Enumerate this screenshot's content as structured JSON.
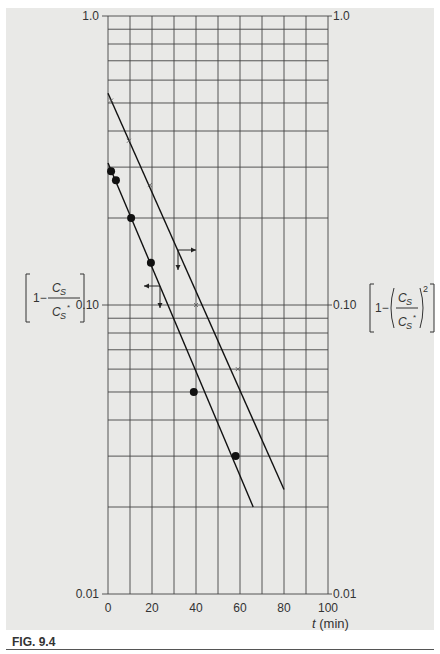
{
  "figure": {
    "caption": "FIG. 9.4",
    "x_axis_title": "t (min)",
    "left_axis_title": "[1 − C_S / C_S*]",
    "right_axis_title": "[1 − (C_S / C_S*)²]",
    "left_ticks": [
      "1.0",
      "0.10",
      "0.01"
    ],
    "right_ticks": [
      "1.0",
      "0.10",
      "0.01"
    ],
    "x_ticks": [
      "0",
      "20",
      "40",
      "60",
      "80",
      "100"
    ],
    "colors": {
      "background": "#e9e9e7",
      "grid": "#444444",
      "ink": "#111111"
    }
  },
  "chart_data": {
    "type": "scatter",
    "title": "",
    "xlabel": "t (min)",
    "ylabel_left": "1 − C_S/C_S*",
    "ylabel_right": "1 − (C_S/C_S*)²",
    "xlim": [
      0,
      100
    ],
    "ylim": [
      0.01,
      1.0
    ],
    "yscale": "log",
    "grid": true,
    "x_ticks": [
      0,
      20,
      40,
      60,
      80,
      100
    ],
    "x_minor_grid_step": 10,
    "y_ticks": [
      0.01,
      0.1,
      1.0
    ],
    "series": [
      {
        "name": "1 − C_S/C_S* (filled circles, left axis)",
        "marker": "filled-circle",
        "x": [
          1.4,
          3.6,
          10.5,
          19.5,
          39,
          58
        ],
        "y": [
          0.29,
          0.27,
          0.2,
          0.14,
          0.05,
          0.03
        ],
        "fit_line": {
          "x": [
            0,
            66
          ],
          "y": [
            0.31,
            0.02
          ]
        }
      },
      {
        "name": "1 − (C_S/C_S*)² (x markers, right axis)",
        "marker": "x",
        "x": [
          1.4,
          9.5,
          19,
          40,
          59
        ],
        "y": [
          0.51,
          0.37,
          0.26,
          0.1,
          0.06
        ],
        "fit_line": {
          "x": [
            0,
            80
          ],
          "y": [
            0.54,
            0.023
          ]
        }
      }
    ],
    "annotations": [
      {
        "type": "arrow-right-then-down",
        "at": [
          31,
          0.19
        ],
        "points_to": "upper line / right axis"
      },
      {
        "type": "arrow-left-then-down",
        "at": [
          23,
          0.125
        ],
        "points_to": "lower line / left axis"
      }
    ]
  }
}
